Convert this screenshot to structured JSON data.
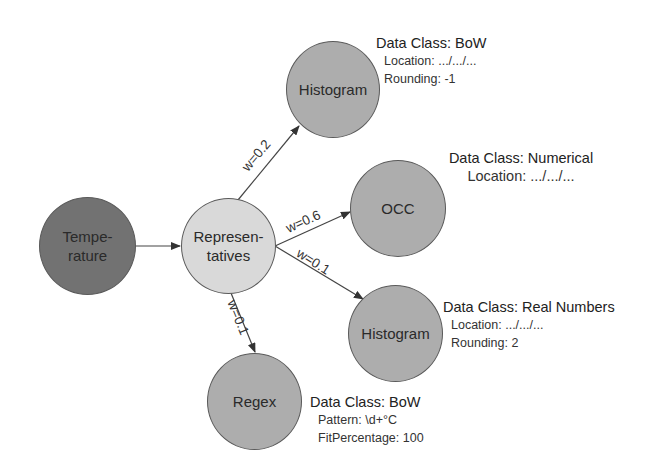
{
  "diagram": {
    "nodes": {
      "temperature": {
        "label": "Tempe-\nrature",
        "color": "#727272"
      },
      "representatives": {
        "label": "Represen-\ntatives",
        "color": "#d9d9d9"
      },
      "histogram_top": {
        "label": "Histogram",
        "color": "#adadad"
      },
      "occ": {
        "label": "OCC",
        "color": "#adadad"
      },
      "histogram_bottom": {
        "label": "Histogram",
        "color": "#adadad"
      },
      "regex": {
        "label": "Regex",
        "color": "#adadad"
      }
    },
    "edges": [
      {
        "from": "temperature",
        "to": "representatives",
        "label": ""
      },
      {
        "from": "representatives",
        "to": "histogram_top",
        "label": "w=0.2"
      },
      {
        "from": "representatives",
        "to": "occ",
        "label": "w=0.6"
      },
      {
        "from": "representatives",
        "to": "histogram_bottom",
        "label": "w=0.1"
      },
      {
        "from": "representatives",
        "to": "regex",
        "label": "w=0.1"
      }
    ],
    "annotations": {
      "histogram_top": {
        "title": "Data Class: BoW",
        "lines": [
          "Location: .../.../...",
          "Rounding: -1"
        ]
      },
      "occ": {
        "title": "Data Class: Numerical",
        "lines": [
          "Location: .../.../..."
        ]
      },
      "histogram_bottom": {
        "title": "Data Class: Real Numbers",
        "lines": [
          "Location: .../.../...",
          "Rounding: 2"
        ]
      },
      "regex": {
        "title": "Data Class: BoW",
        "lines": [
          "Pattern: \\d+°C",
          "FitPercentage: 100"
        ]
      }
    }
  }
}
